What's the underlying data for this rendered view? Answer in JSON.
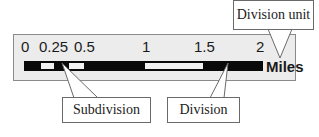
{
  "diagram": {
    "scale_bar": {
      "tick_labels": [
        "0",
        "0.25",
        "0.5",
        "1",
        "1.5",
        "2"
      ],
      "unit": "Miles",
      "segments": [
        {
          "from": 0,
          "to": 0.125,
          "color": "black"
        },
        {
          "from": 0.125,
          "to": 0.25,
          "color": "white"
        },
        {
          "from": 0.25,
          "to": 0.375,
          "color": "black"
        },
        {
          "from": 0.375,
          "to": 0.5,
          "color": "white"
        },
        {
          "from": 0.5,
          "to": 1,
          "color": "black"
        },
        {
          "from": 1,
          "to": 1.5,
          "color": "white"
        },
        {
          "from": 1.5,
          "to": 2,
          "color": "black"
        }
      ],
      "colors": {
        "bar_dark": "#0a0a0a",
        "bar_light": "#f2f2f2",
        "frame_fill": "#ececec"
      }
    },
    "callouts": {
      "division_unit": "Division unit",
      "subdivision": "Subdivision",
      "division": "Division"
    }
  }
}
